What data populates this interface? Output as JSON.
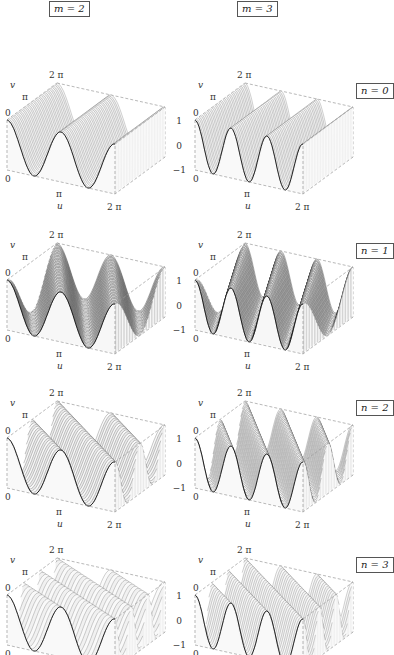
{
  "figure": {
    "column_labels": [
      "m = 2",
      "m = 3"
    ],
    "row_labels": [
      "n = 0",
      "n = 1",
      "n = 2",
      "n = 3"
    ],
    "axes": {
      "u_label": "u",
      "v_label": "v",
      "u_ticks": [
        "0",
        "π",
        "2 π"
      ],
      "v_ticks": [
        "0",
        "π",
        "2 π"
      ],
      "z_ticks": [
        "1",
        "0",
        "−1"
      ]
    },
    "colors": {
      "mesh_line": "#1a1a1a",
      "surface_light": "#e6e6e6",
      "surface_dark": "#3a3a3a",
      "box_dash": "#9a9a9a",
      "label_border": "#555555"
    }
  },
  "chart_data": {
    "type": "surface-grid",
    "title": "",
    "xlabel": "u",
    "ylabel": "v",
    "zlabel": "",
    "xlim": [
      0,
      6.2832
    ],
    "ylim": [
      0,
      6.2832
    ],
    "zlim": [
      -1,
      1
    ],
    "x_ticks": [
      "0",
      "π",
      "2π"
    ],
    "y_ticks": [
      "0",
      "π",
      "2π"
    ],
    "z_ticks": [
      "-1",
      "0",
      "1"
    ],
    "grid": {
      "rows": "n",
      "cols": "m",
      "row_values": [
        0,
        1,
        2,
        3
      ],
      "col_values": [
        2,
        3
      ]
    },
    "panels": [
      {
        "row": 0,
        "col": 0,
        "n": 0,
        "m": 2,
        "u_peaks": 2,
        "v_oscillations": 0,
        "shading": "light"
      },
      {
        "row": 0,
        "col": 1,
        "n": 0,
        "m": 3,
        "u_peaks": 3,
        "v_oscillations": 0,
        "shading": "light"
      },
      {
        "row": 1,
        "col": 0,
        "n": 1,
        "m": 2,
        "u_peaks": 2,
        "v_oscillations": 1,
        "shading": "dark"
      },
      {
        "row": 1,
        "col": 1,
        "n": 1,
        "m": 3,
        "u_peaks": 3,
        "v_oscillations": 1,
        "shading": "dark"
      },
      {
        "row": 2,
        "col": 0,
        "n": 2,
        "m": 2,
        "u_peaks": 2,
        "v_oscillations": 2,
        "shading": "medium"
      },
      {
        "row": 2,
        "col": 1,
        "n": 2,
        "m": 3,
        "u_peaks": 3,
        "v_oscillations": 2,
        "shading": "medium"
      },
      {
        "row": 3,
        "col": 0,
        "n": 3,
        "m": 2,
        "u_peaks": 2,
        "v_oscillations": 3,
        "shading": "light"
      },
      {
        "row": 3,
        "col": 1,
        "n": 3,
        "m": 3,
        "u_peaks": 3,
        "v_oscillations": 3,
        "shading": "light"
      }
    ],
    "function_form": "z = cos(m·u + n·v)"
  }
}
